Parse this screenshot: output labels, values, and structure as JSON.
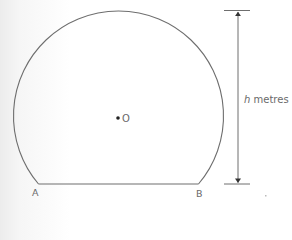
{
  "diagram": {
    "points": {
      "A": "A",
      "B": "B",
      "O": "O"
    },
    "height_label": {
      "variable": "h",
      "unit": "metres"
    },
    "colors": {
      "stroke": "#6e6e6e",
      "text": "#6a6a6a",
      "background": "#ffffff"
    }
  }
}
